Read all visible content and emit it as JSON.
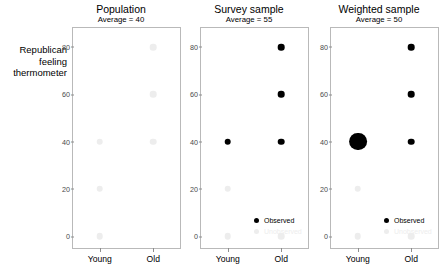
{
  "chart_data": {
    "type": "scatter",
    "title": "",
    "ylabel": "Republican\nfeeling\nthermometer",
    "xlabel": "",
    "ylim": [
      -5,
      88
    ],
    "yticks": [
      0,
      20,
      40,
      60,
      80
    ],
    "ytick_labels": [
      "0",
      "20",
      "40",
      "60",
      "80"
    ],
    "categories": [
      "Young",
      "Old"
    ],
    "grid": false,
    "legend_position": "bottom-right",
    "legend": [
      {
        "label": "Observed",
        "color": "#000000"
      },
      {
        "label": "Unobserved",
        "color": "#ededed"
      }
    ],
    "panels": [
      {
        "title": "Population",
        "subtitle": "Average = 40",
        "average": 40,
        "points": [
          {
            "x": "Young",
            "y": 0,
            "observed": false,
            "size": 1
          },
          {
            "x": "Young",
            "y": 20,
            "observed": false,
            "size": 1
          },
          {
            "x": "Young",
            "y": 40,
            "observed": false,
            "size": 1
          },
          {
            "x": "Old",
            "y": 40,
            "observed": false,
            "size": 1
          },
          {
            "x": "Old",
            "y": 60,
            "observed": false,
            "size": 1
          },
          {
            "x": "Old",
            "y": 80,
            "observed": false,
            "size": 1
          }
        ],
        "show_legend": false
      },
      {
        "title": "Survey sample",
        "subtitle": "Average = 55",
        "average": 55,
        "points": [
          {
            "x": "Young",
            "y": 0,
            "observed": false,
            "size": 1
          },
          {
            "x": "Young",
            "y": 20,
            "observed": false,
            "size": 1
          },
          {
            "x": "Young",
            "y": 40,
            "observed": true,
            "size": 1
          },
          {
            "x": "Old",
            "y": 0,
            "observed": false,
            "size": 1
          },
          {
            "x": "Old",
            "y": 40,
            "observed": true,
            "size": 1
          },
          {
            "x": "Old",
            "y": 60,
            "observed": true,
            "size": 1
          },
          {
            "x": "Old",
            "y": 80,
            "observed": true,
            "size": 1
          }
        ],
        "show_legend": true
      },
      {
        "title": "Weighted sample",
        "subtitle": "Average = 50",
        "average": 50,
        "points": [
          {
            "x": "Young",
            "y": 0,
            "observed": false,
            "size": 1
          },
          {
            "x": "Young",
            "y": 20,
            "observed": false,
            "size": 1
          },
          {
            "x": "Young",
            "y": 40,
            "observed": true,
            "size": 2.7
          },
          {
            "x": "Old",
            "y": 0,
            "observed": false,
            "size": 1
          },
          {
            "x": "Old",
            "y": 40,
            "observed": true,
            "size": 1
          },
          {
            "x": "Old",
            "y": 60,
            "observed": true,
            "size": 1
          },
          {
            "x": "Old",
            "y": 80,
            "observed": true,
            "size": 1
          }
        ],
        "show_legend": true
      }
    ],
    "colors": {
      "observed": "#000000",
      "unobserved": "#ededed",
      "axis": "#b9b9b9",
      "tick_text": "#4a4a4a",
      "text": "#000000"
    }
  }
}
